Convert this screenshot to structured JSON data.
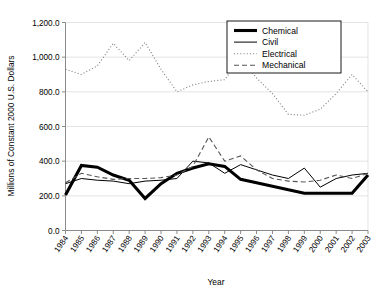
{
  "chart_data": {
    "type": "line",
    "title": "",
    "xlabel": "Year",
    "ylabel": "Millions of Constant 2000 U.S. Dollars",
    "x": [
      1984,
      1985,
      1986,
      1987,
      1988,
      1989,
      1990,
      1991,
      1992,
      1993,
      1994,
      1995,
      1996,
      1997,
      1998,
      1999,
      2000,
      2001,
      2002,
      2003
    ],
    "xtick_labels": [
      "1984",
      "1985",
      "1986",
      "1987",
      "1988",
      "1989",
      "1990",
      "1991",
      "1992",
      "1993",
      "1994",
      "1995",
      "1996",
      "1997",
      "1998",
      "1999",
      "2000",
      "2001",
      "2002",
      "2003"
    ],
    "ytick_labels": [
      "0.0",
      "200.0",
      "400.0",
      "600.0",
      "800.0",
      "1,000.0",
      "1,200.0"
    ],
    "ytick_values": [
      0,
      200,
      400,
      600,
      800,
      1000,
      1200
    ],
    "ylim": [
      0,
      1200
    ],
    "xlim": [
      1984,
      2003
    ],
    "grid": true,
    "legend_position": "top-right",
    "series": [
      {
        "name": "Chemical",
        "style": "thick-solid",
        "color": "#000000",
        "width": 3.1,
        "dash": "none",
        "values": [
          205,
          375,
          365,
          320,
          290,
          185,
          270,
          330,
          360,
          385,
          370,
          295,
          275,
          255,
          235,
          215,
          215,
          215,
          215,
          320
        ]
      },
      {
        "name": "Civil",
        "style": "thin-solid",
        "color": "#000000",
        "width": 1.0,
        "dash": "none",
        "values": [
          270,
          300,
          290,
          285,
          270,
          285,
          290,
          300,
          400,
          390,
          330,
          380,
          350,
          320,
          300,
          360,
          250,
          300,
          320,
          330
        ]
      },
      {
        "name": "Electrical",
        "style": "dotted",
        "color": "#7a7a7a",
        "width": 1.1,
        "dash": "1,2.2",
        "values": [
          930,
          900,
          950,
          1080,
          980,
          1085,
          930,
          800,
          840,
          860,
          870,
          1000,
          880,
          790,
          670,
          665,
          700,
          790,
          900,
          800
        ]
      },
      {
        "name": "Mechanical",
        "style": "dashed",
        "color": "#555555",
        "width": 1.1,
        "dash": "5,3",
        "values": [
          275,
          330,
          310,
          295,
          300,
          300,
          305,
          320,
          370,
          540,
          400,
          430,
          350,
          300,
          285,
          280,
          290,
          320,
          300,
          330
        ]
      }
    ]
  },
  "legend": {
    "items": [
      {
        "label": "Chemical"
      },
      {
        "label": "Civil"
      },
      {
        "label": "Electrical"
      },
      {
        "label": "Mechanical"
      }
    ]
  },
  "axes": {
    "x_title": "Year",
    "y_title": "Millions of Constant 2000 U.S. Dollars"
  }
}
